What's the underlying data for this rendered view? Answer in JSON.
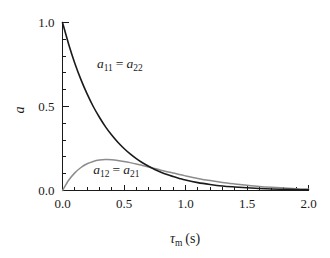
{
  "chart_data": {
    "type": "line",
    "title": "",
    "xlabel": "τm (s)",
    "xlabel_base": "τ",
    "xlabel_sub": "m",
    "xlabel_unit": "(s)",
    "ylabel": "a",
    "xlim": [
      0.0,
      2.0
    ],
    "ylim": [
      0.0,
      1.0
    ],
    "xticks": [
      0.0,
      0.5,
      1.0,
      1.5,
      2.0
    ],
    "xtick_labels": [
      "0.0",
      "0.5",
      "1.0",
      "1.5",
      "2.0"
    ],
    "yticks": [
      0.0,
      0.5,
      1.0
    ],
    "ytick_labels": [
      "0.0",
      "0.5",
      "1.0"
    ],
    "x_minor_step": 0.1,
    "y_minor_step": 0.1,
    "grid": false,
    "legend": "inline-annotations",
    "tick_direction": "in",
    "spines": [
      "left",
      "bottom"
    ],
    "series": [
      {
        "name": "a11 = a22",
        "name_base": "a",
        "name_sub1": "11",
        "name_eq": "=",
        "name_base2": "a",
        "name_sub2": "22",
        "color": "#1a1a1a",
        "width": 1.6,
        "annotation_x": 0.28,
        "annotation_y": 0.73,
        "x": [
          0.0,
          0.05,
          0.1,
          0.15,
          0.2,
          0.25,
          0.3,
          0.35,
          0.4,
          0.45,
          0.5,
          0.55,
          0.6,
          0.65,
          0.7,
          0.75,
          0.8,
          0.85,
          0.9,
          0.95,
          1.0,
          1.1,
          1.2,
          1.3,
          1.4,
          1.5,
          1.6,
          1.7,
          1.8,
          1.9,
          2.0
        ],
        "y": [
          1.0,
          0.871,
          0.758,
          0.66,
          0.575,
          0.5,
          0.436,
          0.379,
          0.33,
          0.287,
          0.25,
          0.218,
          0.19,
          0.165,
          0.144,
          0.125,
          0.109,
          0.095,
          0.083,
          0.072,
          0.062,
          0.047,
          0.036,
          0.027,
          0.021,
          0.016,
          0.012,
          0.009,
          0.007,
          0.005,
          0.004
        ]
      },
      {
        "name": "a12 = a21",
        "name_base": "a",
        "name_sub1": "12",
        "name_eq": "=",
        "name_base2": "a",
        "name_sub2": "21",
        "color": "#8c8c8c",
        "width": 1.5,
        "annotation_x": 0.25,
        "annotation_y": 0.1,
        "peak_x": 0.3,
        "peak_y": 0.185,
        "x": [
          0.0,
          0.05,
          0.1,
          0.15,
          0.2,
          0.25,
          0.3,
          0.35,
          0.4,
          0.45,
          0.5,
          0.55,
          0.6,
          0.65,
          0.7,
          0.75,
          0.8,
          0.85,
          0.9,
          0.95,
          1.0,
          1.1,
          1.2,
          1.3,
          1.4,
          1.5,
          1.6,
          1.7,
          1.8,
          1.9,
          2.0
        ],
        "y": [
          0.0,
          0.061,
          0.105,
          0.137,
          0.159,
          0.173,
          0.181,
          0.184,
          0.183,
          0.179,
          0.173,
          0.166,
          0.158,
          0.149,
          0.14,
          0.131,
          0.121,
          0.112,
          0.104,
          0.095,
          0.087,
          0.072,
          0.059,
          0.048,
          0.039,
          0.031,
          0.024,
          0.019,
          0.015,
          0.011,
          0.009
        ]
      }
    ]
  },
  "colors": {
    "axis": "#1a1a1a",
    "curve_primary": "#1a1a1a",
    "curve_secondary": "#8c8c8c",
    "background": "#ffffff"
  }
}
